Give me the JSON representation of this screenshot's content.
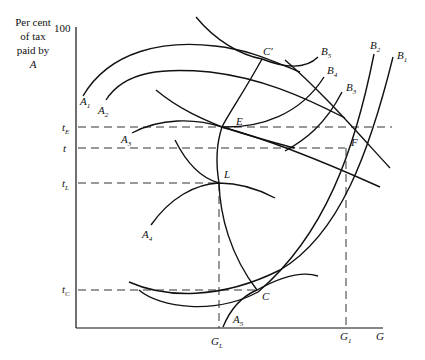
{
  "figure": {
    "type": "economic-diagram",
    "y_axis": {
      "label_lines": [
        "Per cent",
        "of tax",
        "paid by",
        "A"
      ],
      "max_tick": "100"
    },
    "x_axis": {
      "label": "G",
      "ticks": [
        {
          "main": "G",
          "sub": "L"
        },
        {
          "main": "G",
          "sub": "1"
        }
      ]
    },
    "y_ticks": [
      {
        "main": "t",
        "sub": "E"
      },
      {
        "main": "t",
        "sub": ""
      },
      {
        "main": "t",
        "sub": "L"
      },
      {
        "main": "t",
        "sub": "C"
      }
    ],
    "curves_A": [
      {
        "main": "A",
        "sub": "1"
      },
      {
        "main": "A",
        "sub": "2"
      },
      {
        "main": "A",
        "sub": "3"
      },
      {
        "main": "A",
        "sub": "4"
      },
      {
        "main": "A",
        "sub": "5"
      }
    ],
    "curves_B": [
      {
        "main": "B",
        "sub": "1"
      },
      {
        "main": "B",
        "sub": "2"
      },
      {
        "main": "B",
        "sub": "3"
      },
      {
        "main": "B",
        "sub": "4"
      },
      {
        "main": "B",
        "sub": "5"
      }
    ],
    "points": {
      "C_prime": "C′",
      "E": "E",
      "L": "L",
      "F": "F",
      "C": "C"
    }
  }
}
